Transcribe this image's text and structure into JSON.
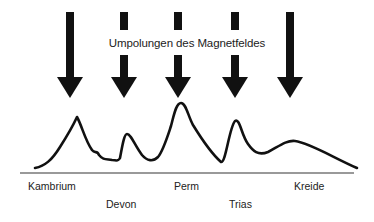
{
  "diagram": {
    "title": "Umpolungen des Magnetfeldes",
    "colors": {
      "ink": "#111111",
      "axis": "#777777",
      "text": "#222222"
    },
    "arrows": [
      {
        "x": 70,
        "type": "full"
      },
      {
        "x": 124,
        "type": "broken"
      },
      {
        "x": 178,
        "type": "broken"
      },
      {
        "x": 235,
        "type": "broken"
      },
      {
        "x": 290,
        "type": "full"
      }
    ],
    "periods": [
      {
        "name": "Kambrium",
        "row": 1
      },
      {
        "name": "Devon",
        "row": 2
      },
      {
        "name": "Perm",
        "row": 1
      },
      {
        "name": "Trias",
        "row": 2
      },
      {
        "name": "Kreide",
        "row": 1
      }
    ],
    "curve_description": "Extinction-rate curve with peaks near Kambrium, Devon, Perm (highest), Trias and a broad hump near Kreide"
  }
}
